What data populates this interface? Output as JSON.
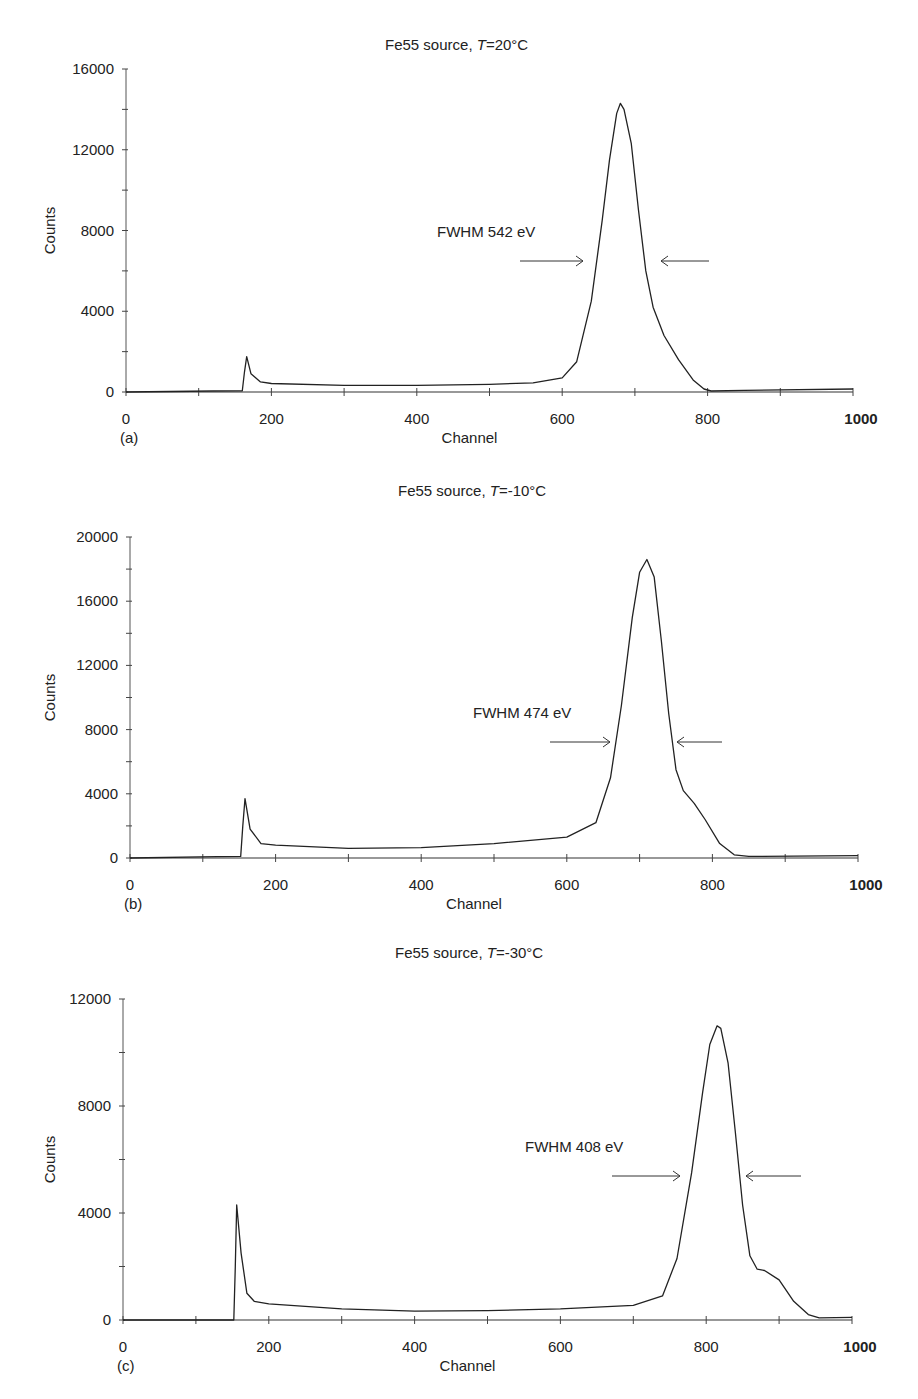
{
  "chart_data": [
    {
      "panel": "(a)",
      "type": "line",
      "title": "Fe55 source, T=20°C",
      "title_prefix": "Fe55 source, ",
      "title_var": "T",
      "title_suffix": "=20°C",
      "xlabel": "Channel",
      "ylabel": "Counts",
      "xlim": [
        0,
        1000
      ],
      "ylim": [
        0,
        16000
      ],
      "x_ticks": [
        0,
        200,
        400,
        600,
        800,
        1000
      ],
      "y_ticks": [
        0,
        4000,
        8000,
        12000,
        16000
      ],
      "grid": false,
      "annotation": "FWHM 542 eV",
      "peak": {
        "channel": 680,
        "counts": 14300
      },
      "x": [
        0,
        120,
        160,
        163,
        166,
        172,
        185,
        200,
        300,
        400,
        500,
        560,
        600,
        620,
        640,
        655,
        665,
        675,
        680,
        685,
        695,
        705,
        715,
        725,
        740,
        760,
        780,
        795,
        805,
        850,
        1000
      ],
      "values": [
        0,
        50,
        60,
        1000,
        1750,
        900,
        500,
        420,
        330,
        330,
        380,
        450,
        700,
        1500,
        4500,
        8500,
        11500,
        13800,
        14300,
        14000,
        12300,
        9000,
        6000,
        4200,
        2800,
        1600,
        600,
        150,
        50,
        80,
        150
      ]
    },
    {
      "panel": "(b)",
      "type": "line",
      "title": "Fe55 source, T=-10°C",
      "title_prefix": "Fe55 source, ",
      "title_var": "T",
      "title_suffix": "=-10°C",
      "xlabel": "Channel",
      "ylabel": "Counts",
      "xlim": [
        0,
        1000
      ],
      "ylim": [
        0,
        20000
      ],
      "x_ticks": [
        0,
        200,
        400,
        600,
        800,
        1000
      ],
      "y_ticks": [
        0,
        4000,
        8000,
        12000,
        16000,
        20000
      ],
      "grid": false,
      "annotation": "FWHM 474 eV",
      "peak": {
        "channel": 710,
        "counts": 18600
      },
      "x": [
        0,
        120,
        152,
        155,
        158,
        165,
        180,
        200,
        300,
        400,
        500,
        600,
        640,
        660,
        675,
        690,
        700,
        710,
        720,
        730,
        740,
        750,
        760,
        775,
        790,
        810,
        830,
        850,
        1000
      ],
      "values": [
        0,
        80,
        100,
        2000,
        3700,
        1800,
        900,
        800,
        600,
        650,
        900,
        1300,
        2200,
        5000,
        9500,
        15000,
        17800,
        18600,
        17500,
        13500,
        9000,
        5500,
        4200,
        3400,
        2400,
        900,
        200,
        100,
        150
      ]
    },
    {
      "panel": "(c)",
      "type": "line",
      "title": "Fe55 source, T=-30°C",
      "title_prefix": "Fe55 source, ",
      "title_var": "T",
      "title_suffix": "=-30°C",
      "xlabel": "Channel",
      "ylabel": "Counts",
      "xlim": [
        0,
        1000
      ],
      "ylim": [
        0,
        12000
      ],
      "x_ticks": [
        0,
        200,
        400,
        600,
        800,
        1000
      ],
      "y_ticks": [
        0,
        4000,
        8000,
        12000
      ],
      "grid": false,
      "annotation": "FWHM 408 eV",
      "peak": {
        "channel": 818,
        "counts": 11000
      },
      "x": [
        0,
        100,
        152,
        154,
        156,
        162,
        170,
        180,
        200,
        300,
        400,
        500,
        600,
        700,
        740,
        760,
        780,
        795,
        805,
        815,
        820,
        830,
        840,
        850,
        860,
        870,
        880,
        900,
        920,
        940,
        955,
        1000
      ],
      "values": [
        0,
        0,
        0,
        2000,
        4300,
        2500,
        1000,
        700,
        600,
        420,
        330,
        350,
        420,
        550,
        900,
        2300,
        5500,
        8500,
        10300,
        11000,
        10900,
        9600,
        7000,
        4300,
        2400,
        1900,
        1850,
        1500,
        700,
        200,
        80,
        100
      ]
    }
  ],
  "panels": {
    "a": {
      "label": "(a)",
      "title_prefix": "Fe55 source, ",
      "title_var": "T",
      "title_suffix": "=20°C",
      "xlabel": "Channel",
      "ylabel": "Counts",
      "annotation": "FWHM 542 eV"
    },
    "b": {
      "label": "(b)",
      "title_prefix": "Fe55 source, ",
      "title_var": "T",
      "title_suffix": "=-10°C",
      "xlabel": "Channel",
      "ylabel": "Counts",
      "annotation": "FWHM 474 eV"
    },
    "c": {
      "label": "(c)",
      "title_prefix": "Fe55 source, ",
      "title_var": "T",
      "title_suffix": "=-30°C",
      "xlabel": "Channel",
      "ylabel": "Counts",
      "annotation": "FWHM 408 eV"
    }
  }
}
